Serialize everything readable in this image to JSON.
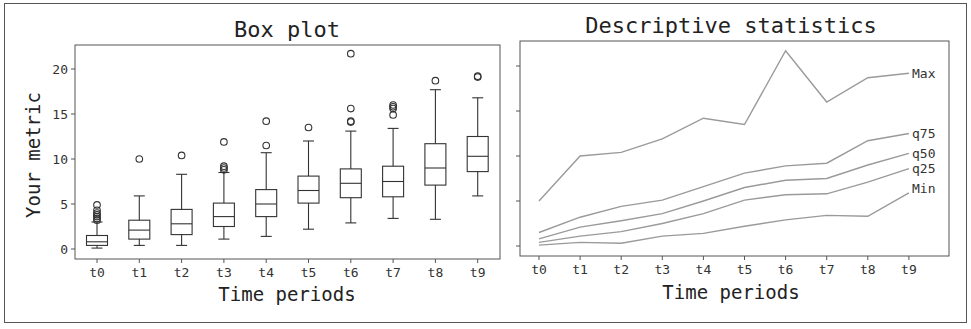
{
  "chart_data": [
    {
      "type": "box",
      "title": "Box plot",
      "xlabel": "Time periods",
      "ylabel": "Your metric",
      "categories": [
        "t0",
        "t1",
        "t2",
        "t3",
        "t4",
        "t5",
        "t6",
        "t7",
        "t8",
        "t9"
      ],
      "yticks": [
        0,
        5,
        10,
        15,
        20
      ],
      "ylim": [
        -1,
        22.5
      ],
      "boxes": [
        {
          "cat": "t0",
          "whislo": 0.1,
          "q1": 0.4,
          "med": 0.8,
          "q3": 1.5,
          "whishi": 3.0,
          "fliers": [
            3.2,
            3.4,
            3.6,
            3.8,
            4.0,
            4.3,
            4.9
          ]
        },
        {
          "cat": "t1",
          "whislo": 0.4,
          "q1": 1.1,
          "med": 2.1,
          "q3": 3.2,
          "whishi": 5.9,
          "fliers": [
            10.0
          ]
        },
        {
          "cat": "t2",
          "whislo": 0.4,
          "q1": 1.6,
          "med": 2.8,
          "q3": 4.4,
          "whishi": 8.3,
          "fliers": [
            10.4
          ]
        },
        {
          "cat": "t3",
          "whislo": 1.1,
          "q1": 2.5,
          "med": 3.6,
          "q3": 5.1,
          "whishi": 8.5,
          "fliers": [
            8.8,
            9.0,
            9.2,
            11.9
          ]
        },
        {
          "cat": "t4",
          "whislo": 1.4,
          "q1": 3.6,
          "med": 5.0,
          "q3": 6.6,
          "whishi": 10.7,
          "fliers": [
            11.5,
            14.2
          ]
        },
        {
          "cat": "t5",
          "whislo": 2.2,
          "q1": 5.1,
          "med": 6.5,
          "q3": 8.1,
          "whishi": 12.0,
          "fliers": [
            13.5
          ]
        },
        {
          "cat": "t6",
          "whislo": 2.9,
          "q1": 5.7,
          "med": 7.3,
          "q3": 8.9,
          "whishi": 13.1,
          "fliers": [
            14.1,
            14.2,
            15.6,
            21.7
          ]
        },
        {
          "cat": "t7",
          "whislo": 3.4,
          "q1": 5.8,
          "med": 7.5,
          "q3": 9.2,
          "whishi": 13.4,
          "fliers": [
            14.9,
            15.6,
            15.8,
            16.0
          ]
        },
        {
          "cat": "t8",
          "whislo": 3.3,
          "q1": 7.1,
          "med": 9.0,
          "q3": 11.7,
          "whishi": 17.7,
          "fliers": [
            18.7
          ]
        },
        {
          "cat": "t9",
          "whislo": 5.9,
          "q1": 8.6,
          "med": 10.3,
          "q3": 12.5,
          "whishi": 16.8,
          "fliers": [
            19.1,
            19.2
          ]
        }
      ]
    },
    {
      "type": "line",
      "title": "Descriptive statistics",
      "xlabel": "Time periods",
      "ylabel": "",
      "categories": [
        "t0",
        "t1",
        "t2",
        "t3",
        "t4",
        "t5",
        "t6",
        "t7",
        "t8",
        "t9"
      ],
      "ylim": [
        -1,
        22.5
      ],
      "shared_y": true,
      "series": [
        {
          "name": "Max",
          "values": [
            5.0,
            10.0,
            10.4,
            11.9,
            14.2,
            13.5,
            21.7,
            16.0,
            18.7,
            19.2
          ]
        },
        {
          "name": "q75",
          "values": [
            1.5,
            3.2,
            4.4,
            5.1,
            6.6,
            8.1,
            8.9,
            9.2,
            11.7,
            12.5
          ]
        },
        {
          "name": "q50",
          "values": [
            0.8,
            2.1,
            2.8,
            3.6,
            5.0,
            6.5,
            7.3,
            7.5,
            9.0,
            10.3
          ]
        },
        {
          "name": "q25",
          "values": [
            0.4,
            1.1,
            1.6,
            2.5,
            3.6,
            5.1,
            5.7,
            5.8,
            7.1,
            8.6
          ]
        },
        {
          "name": "Min",
          "values": [
            0.1,
            0.4,
            0.3,
            1.1,
            1.4,
            2.2,
            2.9,
            3.4,
            3.3,
            5.9
          ]
        }
      ]
    }
  ],
  "labels": {
    "left_title": "Box plot",
    "right_title": "Descriptive statistics",
    "xlabel": "Time periods",
    "ylabel": "Your metric"
  },
  "colors": {
    "box": "#333333",
    "line": "#9a9a9a",
    "frame": "#555555"
  }
}
